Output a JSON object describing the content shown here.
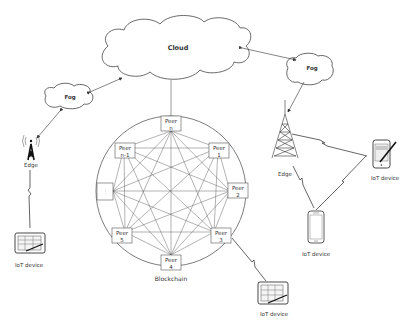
{
  "diagram": {
    "cloud": {
      "label": "Cloud"
    },
    "fog_left": {
      "label": "Fog"
    },
    "fog_right": {
      "label": "Fog"
    },
    "edge_left": {
      "label": "Edge"
    },
    "edge_right": {
      "label": "Edge"
    },
    "blockchain": {
      "label": "Blockchain",
      "peers": [
        {
          "line1": "Peer",
          "line2": "n"
        },
        {
          "line1": "Peer",
          "line2": "1"
        },
        {
          "line1": "Peer",
          "line2": "2"
        },
        {
          "line1": "Peer",
          "line2": "3"
        },
        {
          "line1": "Peer",
          "line2": "4"
        },
        {
          "line1": "Peer",
          "line2": "5"
        },
        {
          "line1": "",
          "line2": "....."
        },
        {
          "line1": "Peer",
          "line2": "n-1"
        }
      ]
    },
    "iot_left": {
      "label": "IoT device"
    },
    "iot_bottom": {
      "label": "IoT device"
    },
    "iot_right_tablet": {
      "label": "IoT device"
    },
    "iot_right_phone": {
      "label": "IoT device"
    }
  }
}
